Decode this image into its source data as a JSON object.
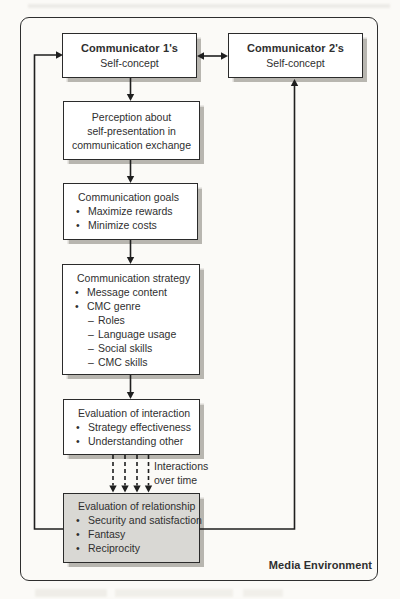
{
  "page": {
    "boxes": {
      "communicator1": {
        "title": "Communicator 1's",
        "subtitle": "Self-concept"
      },
      "communicator2": {
        "title": "Communicator 2's",
        "subtitle": "Self-concept"
      },
      "perception": {
        "lines": [
          "Perception about",
          "self-presentation in",
          "communication exchange"
        ]
      },
      "goals": {
        "title": "Communication goals",
        "bullets": [
          "Maximize rewards",
          "Minimize costs"
        ]
      },
      "strategy": {
        "title": "Communication strategy",
        "bullets": [
          "Message content",
          "CMC genre"
        ],
        "sub_bullets": [
          "Roles",
          "Language usage",
          "Social skills",
          "CMC skills"
        ]
      },
      "evaluation_interaction": {
        "title": "Evaluation of interaction",
        "bullets": [
          "Strategy effectiveness",
          "Understanding other"
        ]
      },
      "evaluation_relationship": {
        "title": "Evaluation of relationship",
        "bullets": [
          "Security and satisfaction",
          "Fantasy",
          "Reciprocity"
        ]
      }
    },
    "labels": {
      "interactions_line1": "Interactions",
      "interactions_line2": "over time",
      "media_environment": "Media Environment"
    },
    "markers": {
      "bullet": "•",
      "dash": "–"
    },
    "colors": {
      "box_border": "#2b2b2b",
      "box_fill": "#ffffff",
      "shaded_box_fill": "#d9d8d4",
      "shadow": "#b8b6b0",
      "line": "#1f1f1f",
      "text": "#2f2f2f",
      "page_background": "#fbfaf7"
    }
  }
}
